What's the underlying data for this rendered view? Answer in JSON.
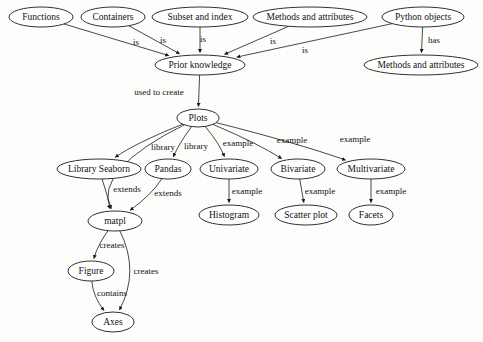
{
  "diagram": {
    "type": "concept-map",
    "background_color": "#fdfdfc",
    "line_color": "#1a1a1a",
    "text_color": "#111111",
    "nodes": [
      {
        "id": "functions",
        "label": "Functions",
        "cx": 41,
        "cy": 17,
        "rx": 32,
        "ry": 10
      },
      {
        "id": "containers",
        "label": "Containers",
        "cx": 113,
        "cy": 17,
        "rx": 32,
        "ry": 10
      },
      {
        "id": "subset",
        "label": "Subset and index",
        "cx": 200,
        "cy": 17,
        "rx": 48,
        "ry": 10
      },
      {
        "id": "methods_top",
        "label": "Methods and attributes",
        "cx": 310,
        "cy": 17,
        "rx": 57,
        "ry": 10
      },
      {
        "id": "python_objects",
        "label": "Python objects",
        "cx": 423,
        "cy": 17,
        "rx": 41,
        "ry": 10
      },
      {
        "id": "prior_knowledge",
        "label": "Prior knowledge",
        "cx": 200,
        "cy": 65,
        "rx": 45,
        "ry": 10
      },
      {
        "id": "methods_right",
        "label": "Methods and attributes",
        "cx": 421,
        "cy": 65,
        "rx": 57,
        "ry": 10
      },
      {
        "id": "plots",
        "label": "Plots",
        "cx": 198,
        "cy": 118,
        "rx": 21,
        "ry": 9
      },
      {
        "id": "library_seaborn",
        "label": "Library Seaborn",
        "cx": 99,
        "cy": 169,
        "rx": 42,
        "ry": 10
      },
      {
        "id": "pandas",
        "label": "Pandas",
        "cx": 168,
        "cy": 169,
        "rx": 23,
        "ry": 10
      },
      {
        "id": "univariate",
        "label": "Univariate",
        "cx": 229,
        "cy": 169,
        "rx": 29,
        "ry": 10
      },
      {
        "id": "bivariate",
        "label": "Bivariate",
        "cx": 298,
        "cy": 169,
        "rx": 27,
        "ry": 10
      },
      {
        "id": "multivariate",
        "label": "Multivariate",
        "cx": 371,
        "cy": 169,
        "rx": 34,
        "ry": 10
      },
      {
        "id": "histogram",
        "label": "Histogram",
        "cx": 229,
        "cy": 215,
        "rx": 30,
        "ry": 10
      },
      {
        "id": "scatter_plot",
        "label": "Scatter plot",
        "cx": 306,
        "cy": 215,
        "rx": 31,
        "ry": 10
      },
      {
        "id": "facets",
        "label": "Facets",
        "cx": 371,
        "cy": 215,
        "rx": 22,
        "ry": 10
      },
      {
        "id": "matpl",
        "label": "matpl",
        "cx": 115,
        "cy": 221,
        "rx": 27,
        "ry": 10
      },
      {
        "id": "figure",
        "label": "Figure",
        "cx": 91,
        "cy": 271,
        "rx": 23,
        "ry": 10
      },
      {
        "id": "axes",
        "label": "Axes",
        "cx": 113,
        "cy": 322,
        "rx": 21,
        "ry": 10
      }
    ],
    "edges": [
      {
        "from": "functions",
        "to": "prior_knowledge",
        "label": "is",
        "label_x": 136,
        "label_y": 43
      },
      {
        "from": "containers",
        "to": "prior_knowledge",
        "label": "is",
        "label_x": 163,
        "label_y": 41
      },
      {
        "from": "subset",
        "to": "prior_knowledge",
        "label": "is",
        "label_x": 203,
        "label_y": 40
      },
      {
        "from": "methods_top",
        "to": "prior_knowledge",
        "label": "is",
        "label_x": 273,
        "label_y": 42
      },
      {
        "from": "python_objects",
        "to": "prior_knowledge",
        "label": "is",
        "label_x": 305,
        "label_y": 51
      },
      {
        "from": "python_objects",
        "to": "methods_right",
        "label": "has",
        "label_x": 434,
        "label_y": 41
      },
      {
        "from": "prior_knowledge",
        "to": "plots",
        "label": "used to create",
        "label_x": 159,
        "label_y": 93
      },
      {
        "from": "plots",
        "to": "matpl",
        "label": "",
        "label_x": 0,
        "label_y": 0
      },
      {
        "from": "plots",
        "to": "library_seaborn",
        "label": "library",
        "label_x": 163,
        "label_y": 148
      },
      {
        "from": "plots",
        "to": "pandas",
        "label": "library",
        "label_x": 196,
        "label_y": 147
      },
      {
        "from": "plots",
        "to": "univariate",
        "label": "example",
        "label_x": 238,
        "label_y": 144
      },
      {
        "from": "plots",
        "to": "bivariate",
        "label": "example",
        "label_x": 292,
        "label_y": 141
      },
      {
        "from": "plots",
        "to": "multivariate",
        "label": "example",
        "label_x": 355,
        "label_y": 140
      },
      {
        "from": "library_seaborn",
        "to": "matpl",
        "label": "extends",
        "label_x": 127,
        "label_y": 190
      },
      {
        "from": "pandas",
        "to": "matpl",
        "label": "extends",
        "label_x": 168,
        "label_y": 194
      },
      {
        "from": "univariate",
        "to": "histogram",
        "label": "example",
        "label_x": 247,
        "label_y": 192
      },
      {
        "from": "bivariate",
        "to": "scatter_plot",
        "label": "example",
        "label_x": 320,
        "label_y": 192
      },
      {
        "from": "multivariate",
        "to": "facets",
        "label": "example",
        "label_x": 391,
        "label_y": 192
      },
      {
        "from": "matpl",
        "to": "figure",
        "label": "creates",
        "label_x": 112,
        "label_y": 246
      },
      {
        "from": "matpl",
        "to": "axes",
        "label": "creates",
        "label_x": 146,
        "label_y": 272
      },
      {
        "from": "figure",
        "to": "axes",
        "label": "contains",
        "label_x": 112,
        "label_y": 294
      }
    ]
  }
}
